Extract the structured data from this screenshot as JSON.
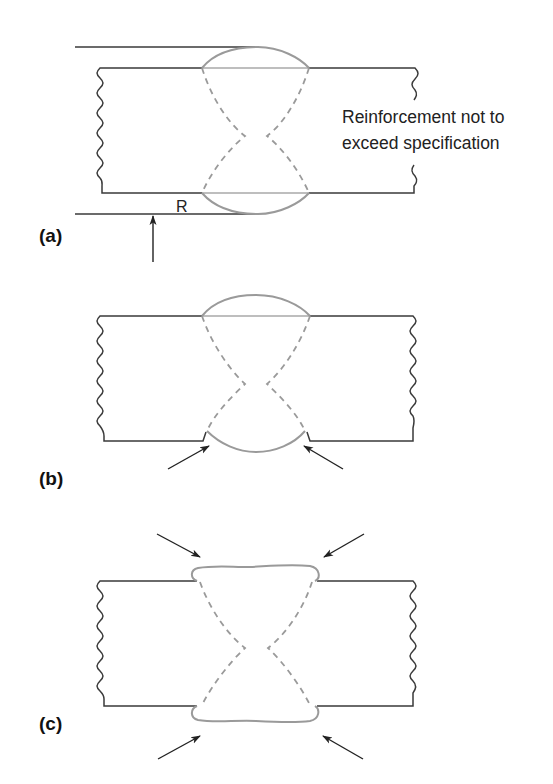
{
  "figure": {
    "panels": [
      {
        "id": "a",
        "label": "(a)",
        "annotation_lines": [
          "Reinforcement not to",
          "exceed specification"
        ],
        "dimension_label": "R",
        "arrows": 1
      },
      {
        "id": "b",
        "label": "(b)",
        "arrows": 2
      },
      {
        "id": "c",
        "label": "(c)",
        "arrows": 4
      }
    ],
    "colors": {
      "plate_outline": "#3a3a3a",
      "weld_outline": "#9a9a9a",
      "arrow": "#222222",
      "background": "#ffffff"
    }
  }
}
